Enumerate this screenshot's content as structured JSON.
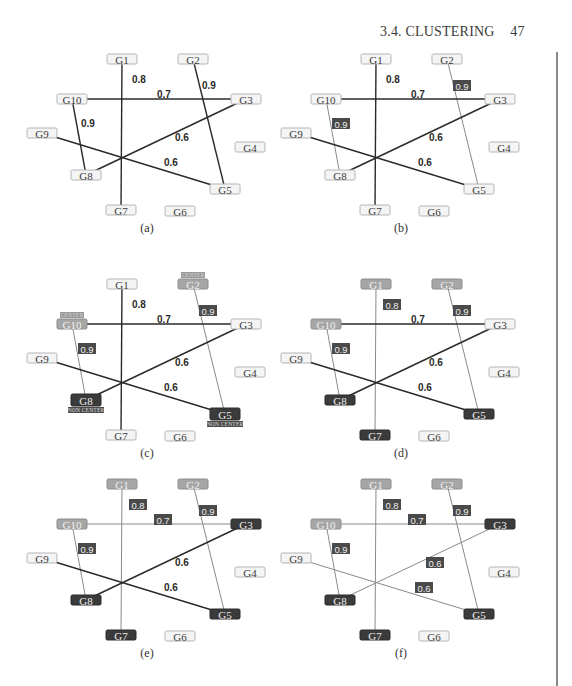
{
  "header": {
    "section_title": "3.4. CLUSTERING",
    "page_number": "47"
  },
  "layout": {
    "node_width": 30,
    "node_height": 10,
    "nodes": {
      "G1": [
        122,
        59
      ],
      "G2": [
        193,
        59
      ],
      "G3": [
        246,
        99
      ],
      "G4": [
        250,
        147
      ],
      "G5": [
        225,
        189
      ],
      "G6": [
        180,
        211
      ],
      "G7": [
        121,
        210
      ],
      "G8": [
        86,
        175
      ],
      "G9": [
        42,
        133
      ],
      "G10": [
        72,
        99
      ]
    },
    "caption_pos": [
      147,
      232
    ]
  },
  "edges": [
    {
      "from": "G1",
      "to": "G7",
      "weight": "0.8",
      "label_pos": [
        138,
        80
      ]
    },
    {
      "from": "G2",
      "to": "G5",
      "weight": "0.9",
      "label_pos": [
        208,
        86
      ]
    },
    {
      "from": "G10",
      "to": "G3",
      "weight": "0.7",
      "label_pos": [
        163,
        95
      ]
    },
    {
      "from": "G10",
      "to": "G8",
      "weight": "0.9",
      "label_pos": [
        87,
        124
      ]
    },
    {
      "from": "G3",
      "to": "G8",
      "weight": "0.6",
      "label_pos": [
        181,
        138
      ]
    },
    {
      "from": "G9",
      "to": "G5",
      "weight": "0.6",
      "label_pos": [
        170,
        163
      ]
    }
  ],
  "panels": [
    {
      "id": "a",
      "caption": "(a)",
      "offset": [
        0,
        0
      ],
      "node_styles": {
        "G1": "light",
        "G2": "light",
        "G3": "light",
        "G4": "light",
        "G5": "light",
        "G6": "light",
        "G7": "light",
        "G8": "light",
        "G9": "light",
        "G10": "light"
      },
      "edge_styles": [
        "dark-plain",
        "dark-plain",
        "dark-plain",
        "dark-plain",
        "dark-plain",
        "dark-plain"
      ],
      "tags": []
    },
    {
      "id": "b",
      "caption": "(b)",
      "offset": [
        254,
        0
      ],
      "node_styles": {
        "G1": "light",
        "G2": "light",
        "G3": "light",
        "G4": "light",
        "G5": "light",
        "G6": "light",
        "G7": "light",
        "G8": "light",
        "G9": "light",
        "G10": "light"
      },
      "edge_styles": [
        "dark-plain",
        "light-box",
        "dark-plain",
        "light-box",
        "dark-plain",
        "dark-plain"
      ],
      "tags": []
    },
    {
      "id": "c",
      "caption": "(c)",
      "offset": [
        0,
        225
      ],
      "node_styles": {
        "G1": "light",
        "G2": "mid",
        "G3": "light",
        "G4": "light",
        "G5": "dark",
        "G6": "light",
        "G7": "light",
        "G8": "dark",
        "G9": "light",
        "G10": "mid"
      },
      "edge_styles": [
        "dark-plain",
        "light-box",
        "dark-plain",
        "light-box",
        "dark-plain",
        "dark-plain"
      ],
      "tags": [
        {
          "node": "G2",
          "label": "CENTER",
          "kind": "center",
          "position": "above"
        },
        {
          "node": "G10",
          "label": "CENTER",
          "kind": "center",
          "position": "above"
        },
        {
          "node": "G8",
          "label": "NON CENTER",
          "kind": "non-center",
          "position": "below"
        },
        {
          "node": "G5",
          "label": "NON CENTER",
          "kind": "non-center",
          "position": "below"
        }
      ]
    },
    {
      "id": "d",
      "caption": "(d)",
      "offset": [
        254,
        225
      ],
      "node_styles": {
        "G1": "mid",
        "G2": "mid",
        "G3": "light",
        "G4": "light",
        "G5": "dark",
        "G6": "light",
        "G7": "dark",
        "G8": "dark",
        "G9": "light",
        "G10": "mid"
      },
      "edge_styles": [
        "light-box",
        "light-box",
        "dark-plain",
        "light-box",
        "dark-plain",
        "dark-plain"
      ],
      "tags": []
    },
    {
      "id": "e",
      "caption": "(e)",
      "offset": [
        0,
        425
      ],
      "node_styles": {
        "G1": "mid",
        "G2": "mid",
        "G3": "dark",
        "G4": "light",
        "G5": "dark",
        "G6": "light",
        "G7": "dark",
        "G8": "dark",
        "G9": "light",
        "G10": "mid"
      },
      "edge_styles": [
        "light-box",
        "light-box",
        "light-box",
        "light-box",
        "dark-plain",
        "dark-plain"
      ],
      "tags": []
    },
    {
      "id": "f",
      "caption": "(f)",
      "offset": [
        254,
        425
      ],
      "node_styles": {
        "G1": "mid",
        "G2": "mid",
        "G3": "dark",
        "G4": "light",
        "G5": "dark",
        "G6": "light",
        "G7": "dark",
        "G8": "dark",
        "G9": "light",
        "G10": "mid"
      },
      "edge_styles": [
        "light-box",
        "light-box",
        "light-box",
        "light-box",
        "light-box",
        "light-box"
      ],
      "tags": []
    }
  ],
  "colors": {
    "node_light_fill": "#f4f4f4",
    "node_mid_fill": "#a6a6a6",
    "node_dark_fill": "#3b3b3b",
    "edge_dark": "#2a2a2a",
    "edge_light": "#8a8a8a",
    "weight_box_fill": "#4a4a4a"
  }
}
